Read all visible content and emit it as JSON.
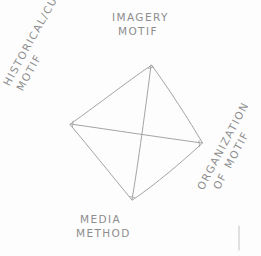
{
  "sketch": {
    "title": "Motif analysis diamond diagram",
    "medium": "pencil-sketch",
    "background_color": "#fdfdfd",
    "stroke_color": "#9a9a9a",
    "text_color": "#8d8d8d",
    "shape": "diamond-with-diagonals",
    "vertices": {
      "top": {
        "x": 151,
        "y": 65
      },
      "left": {
        "x": 70,
        "y": 124
      },
      "right": {
        "x": 202,
        "y": 143
      },
      "bottom": {
        "x": 132,
        "y": 200
      }
    },
    "edges": [
      "top-left",
      "top-right",
      "right-bottom",
      "bottom-left"
    ],
    "diagonals": [
      "top-bottom",
      "left-right"
    ],
    "labels": {
      "top": {
        "position": "top",
        "rotation_deg": 0,
        "line_1": "IMAGERY",
        "line_2": "MOTIF"
      },
      "left": {
        "position": "left",
        "rotation_deg": -61,
        "line_1": "HISTORICAL/CULTURAL",
        "line_2": "MOTIF"
      },
      "right": {
        "position": "right",
        "rotation_deg": -62,
        "line_1": "ORGANIZATION",
        "line_2": "OF MOTIF"
      },
      "bottom": {
        "position": "bottom",
        "rotation_deg": 0,
        "line_1": "MEDIA",
        "line_2": "METHOD"
      }
    },
    "stray_mark": {
      "type": "short-vertical-line",
      "x": 239,
      "y_start": 226,
      "y_end": 250
    }
  }
}
